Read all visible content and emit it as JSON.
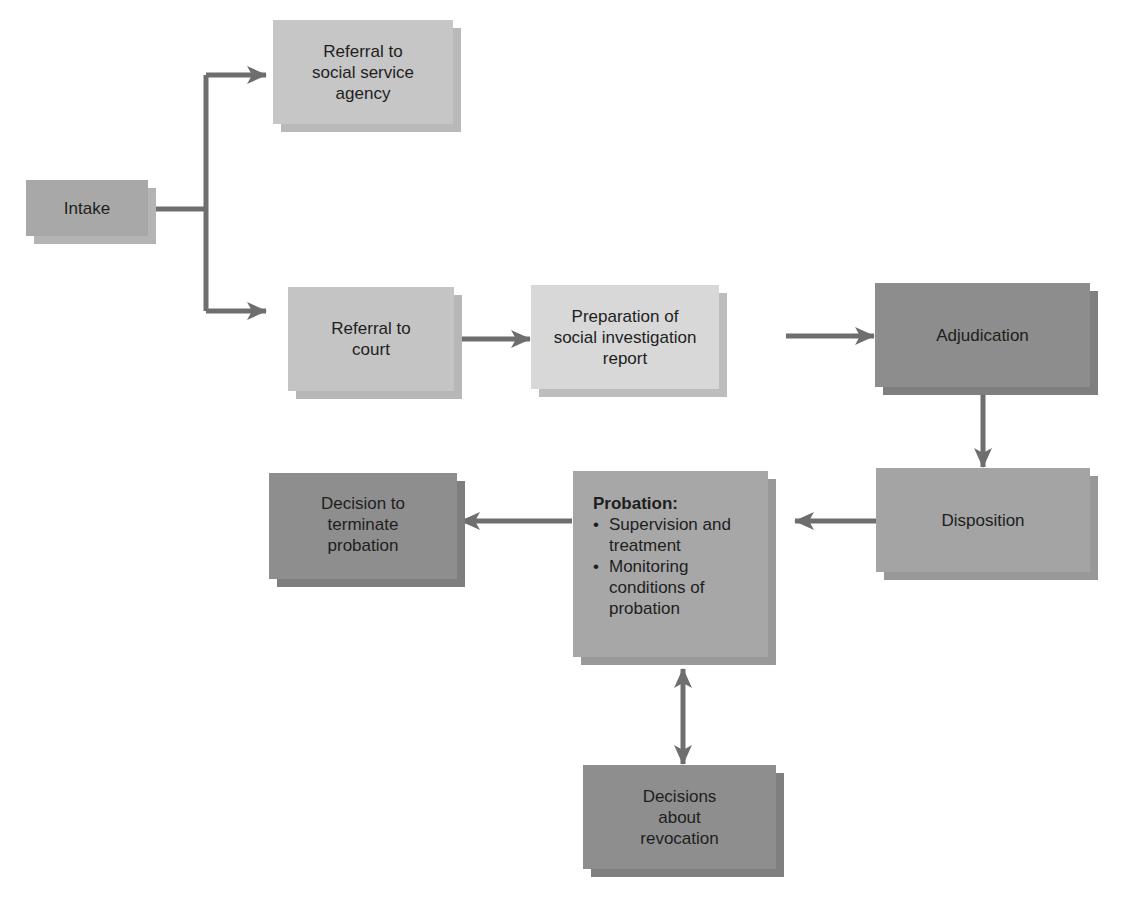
{
  "diagram": {
    "type": "flowchart",
    "colors": {
      "light_box": "#c8c8c8",
      "light_box_shadow": "#b4b4b4",
      "lightest_box": "#d6d6d6",
      "lightest_box_shadow": "#bdbdbd",
      "mid_box": "#a6a6a6",
      "mid_box_shadow": "#959595",
      "dark_box": "#8f8f8f",
      "dark_box_shadow": "#7e7e7e",
      "arrow": "#6e6e6e"
    },
    "nodes": {
      "intake": {
        "label": "Intake"
      },
      "referral_social": {
        "label": "Referral to\nsocial service\nagency"
      },
      "referral_court": {
        "label": "Referral to\ncourt"
      },
      "preparation": {
        "label": "Preparation of\nsocial investigation\nreport"
      },
      "adjudication": {
        "label": "Adjudication"
      },
      "disposition": {
        "label": "Disposition"
      },
      "probation": {
        "title": "Probation:",
        "items": [
          "Supervision and\ntreatment",
          "Monitoring\nconditions of\nprobation"
        ]
      },
      "terminate": {
        "label": "Decision to\nterminate\nprobation"
      },
      "revocation": {
        "label": "Decisions\nabout\nrevocation"
      }
    },
    "edges": [
      {
        "from": "Intake",
        "to": "Referral to social service agency"
      },
      {
        "from": "Intake",
        "to": "Referral to court"
      },
      {
        "from": "Referral to court",
        "to": "Preparation of social investigation report"
      },
      {
        "from": "Preparation of social investigation report",
        "to": "Adjudication"
      },
      {
        "from": "Adjudication",
        "to": "Disposition"
      },
      {
        "from": "Disposition",
        "to": "Probation"
      },
      {
        "from": "Probation",
        "to": "Decision to terminate probation"
      },
      {
        "from": "Probation",
        "to": "Decisions about revocation",
        "bidirectional": true
      }
    ]
  }
}
